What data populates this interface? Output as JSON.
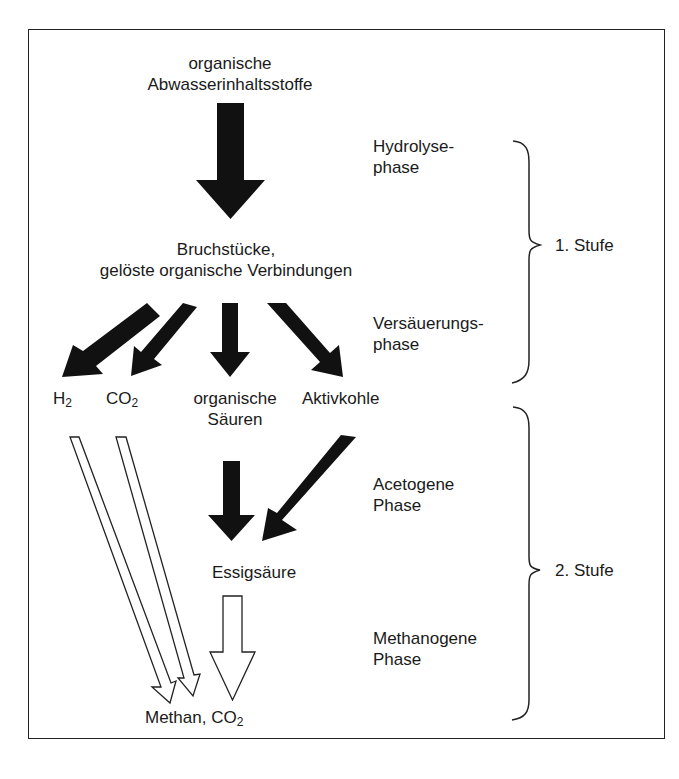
{
  "diagram": {
    "type": "process-flow",
    "nodes": {
      "input": {
        "line1": "organische",
        "line2": "Abwasserinhaltsstoffe"
      },
      "fragments": {
        "line1": "Bruchstücke,",
        "line2": "gelöste organische Verbindungen"
      },
      "h2": {
        "base": "H",
        "sub": "2"
      },
      "co2": {
        "base": "CO",
        "sub": "2"
      },
      "acids": {
        "line1": "organische",
        "line2": "Säuren"
      },
      "activated_carbon": {
        "label": "Aktivkohle"
      },
      "acetic_acid": {
        "label": "Essigsäure"
      },
      "output": {
        "base": "Methan, CO",
        "sub": "2"
      }
    },
    "phases": [
      {
        "line1": "Hydrolyse-",
        "line2": "phase"
      },
      {
        "line1": "Versäuerungs-",
        "line2": "phase"
      },
      {
        "line1": "Acetogene",
        "line2": "Phase"
      },
      {
        "line1": "Methanogene",
        "line2": "Phase"
      }
    ],
    "stages": [
      {
        "label": "1. Stufe"
      },
      {
        "label": "2. Stufe"
      }
    ],
    "colors": {
      "arrow_fill": "#111111",
      "outline": "#222222",
      "background": "#ffffff"
    }
  }
}
